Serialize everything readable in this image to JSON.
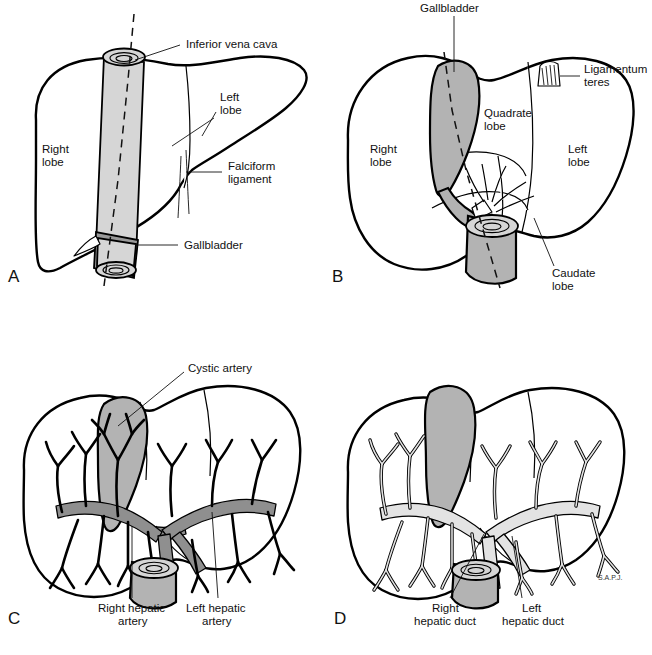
{
  "figure": {
    "signature": "S.A.P.J.",
    "colors": {
      "gallbladder_gray": "#b3b3b3",
      "vessel_cylinder_gray": "#d6d6d6",
      "artery_gray": "#8f8f8f",
      "duct_gray": "#e3e3e3",
      "outline": "#000000",
      "background": "#ffffff"
    }
  },
  "panels": [
    {
      "letter": "A",
      "view": "anterior-surface-view",
      "labels": [
        {
          "id": "inferior-vena-cava",
          "text": "Inferior vena cava"
        },
        {
          "id": "left-lobe",
          "line1": "Left",
          "line2": "lobe"
        },
        {
          "id": "falciform-ligament",
          "line1": "Falciform",
          "line2": "ligament"
        },
        {
          "id": "right-lobe",
          "line1": "Right",
          "line2": "lobe"
        },
        {
          "id": "gallbladder",
          "text": "Gallbladder"
        }
      ]
    },
    {
      "letter": "B",
      "view": "visceral-surface-view",
      "labels": [
        {
          "id": "gallbladder",
          "text": "Gallbladder"
        },
        {
          "id": "ligamentum-teres",
          "line1": "Ligamentum",
          "line2": "teres"
        },
        {
          "id": "quadrate-lobe",
          "line1": "Quadrate",
          "line2": "lobe"
        },
        {
          "id": "right-lobe",
          "line1": "Right",
          "line2": "lobe"
        },
        {
          "id": "left-lobe",
          "line1": "Left",
          "line2": "lobe"
        },
        {
          "id": "caudate-lobe",
          "line1": "Caudate",
          "line2": "lobe"
        }
      ]
    },
    {
      "letter": "C",
      "view": "hepatic-arterial-supply",
      "labels": [
        {
          "id": "cystic-artery",
          "text": "Cystic artery"
        },
        {
          "id": "right-hepatic-artery",
          "line1": "Right hepatic",
          "line2": "artery"
        },
        {
          "id": "left-hepatic-artery",
          "line1": "Left hepatic",
          "line2": "artery"
        }
      ]
    },
    {
      "letter": "D",
      "view": "biliary-duct-system",
      "labels": [
        {
          "id": "right-hepatic-duct",
          "line1": "Right",
          "line2": "hepatic duct"
        },
        {
          "id": "left-hepatic-duct",
          "line1": "Left",
          "line2": "hepatic duct"
        }
      ]
    }
  ]
}
